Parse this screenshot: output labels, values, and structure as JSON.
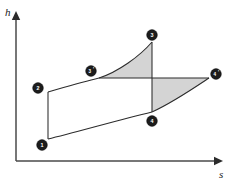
{
  "figure": {
    "type": "thermodynamic-state-diagram",
    "background_color": "#ffffff",
    "line_color": "#2b2b2b",
    "axis_color": "#4a4a4a",
    "marker_fill": "#1c1c1c",
    "marker_text_color": "#ffffff",
    "shade_color": "#d4d4d4"
  },
  "axes": {
    "y": {
      "name": "enthalpy-axis",
      "label": "h",
      "origin": {
        "x": 16,
        "y": 161
      },
      "end": {
        "x": 16,
        "y": 12
      },
      "arrow": true
    },
    "x": {
      "name": "entropy-axis",
      "label": "s",
      "origin": {
        "x": 16,
        "y": 161
      },
      "end": {
        "x": 222,
        "y": 161
      },
      "arrow": true
    }
  },
  "state_points": [
    {
      "id": "1",
      "label": "1",
      "marker_x": 42,
      "marker_y": 145,
      "point_x": 48,
      "point_y": 139,
      "prime": false
    },
    {
      "id": "2",
      "label": "2",
      "marker_x": 38,
      "marker_y": 88,
      "point_x": 48,
      "point_y": 92,
      "prime": false
    },
    {
      "id": "3p",
      "label": "3",
      "marker_x": 91,
      "marker_y": 71,
      "point_x": 99,
      "point_y": 78,
      "prime": true
    },
    {
      "id": "3",
      "label": "3",
      "marker_x": 152,
      "marker_y": 35,
      "point_x": 152,
      "point_y": 42,
      "prime": false
    },
    {
      "id": "4",
      "label": "4",
      "marker_x": 152,
      "marker_y": 121,
      "point_x": 152,
      "point_y": 112,
      "prime": false
    },
    {
      "id": "4p",
      "label": "4",
      "marker_x": 216,
      "marker_y": 74,
      "point_x": 209,
      "point_y": 78,
      "prime": true
    }
  ],
  "processes": [
    {
      "name": "pump-compression-1-2",
      "from": "1",
      "to": "2",
      "path": "M 48 139 L 48 92",
      "style": "straight-vertical"
    },
    {
      "name": "heat-addition-2-3prime",
      "from": "2",
      "to": "3p",
      "path": "M 48 92 C 62 88, 82 82, 99 78",
      "style": "curve"
    },
    {
      "name": "superheat-3prime-3",
      "from": "3p",
      "to": "3",
      "path": "M 99 78 C 118 72, 140 56, 152 42",
      "style": "curve"
    },
    {
      "name": "isobar-3prime-4prime",
      "from": "3p",
      "to": "4p",
      "path": "M 99 78 L 209 78",
      "style": "straight-horizontal"
    },
    {
      "name": "isentropic-expansion-3-4",
      "from": "3",
      "to": "4",
      "path": "M 152 42 L 152 112",
      "style": "straight-vertical"
    },
    {
      "name": "condenser-line-1-4",
      "from": "1",
      "to": "4",
      "path": "M 48 139 C 74 133, 118 120, 152 112",
      "style": "curve"
    },
    {
      "name": "expansion-loss-4-4prime",
      "from": "4",
      "to": "4p",
      "path": "M 152 112 C 172 103, 194 88, 209 78",
      "style": "curve"
    }
  ],
  "shaded_regions": [
    {
      "name": "upper-loss-area",
      "description": "shaded area between 3prime-3 curve, 3-4 vertical and 3prime-4prime horizontal",
      "path": "M 99 78 C 118 72, 140 56, 152 42 L 152 78 Z",
      "color": "#d4d4d4"
    },
    {
      "name": "lower-loss-area",
      "description": "shaded area between 3prime-4prime horizontal, 4-4prime curve and 3-4 vertical",
      "path": "M 152 78 L 209 78 C 194 88, 172 103, 152 112 Z",
      "color": "#d4d4d4"
    }
  ]
}
